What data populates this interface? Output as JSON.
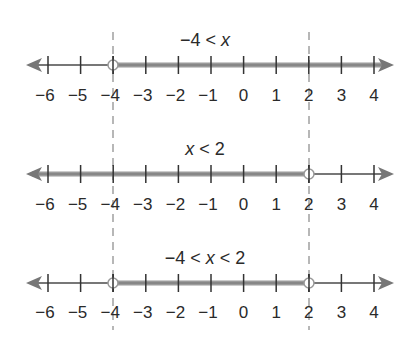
{
  "diagram": {
    "type": "number-line-inequalities",
    "tick_values": [
      -6,
      -5,
      -4,
      -3,
      -2,
      -1,
      0,
      1,
      2,
      3,
      4
    ],
    "tick_labels": [
      "−6",
      "−5",
      "−4",
      "−3",
      "−2",
      "−1",
      "0",
      "1",
      "2",
      "3",
      "4"
    ],
    "dashed_guides_at": [
      -4,
      2
    ],
    "colors": {
      "axis": "#777777",
      "shade": "#8a8a8a",
      "tick": "#333333",
      "text": "#2a2a2a",
      "dashed": "#888888"
    },
    "lines": [
      {
        "title": "−4 < x",
        "title_parts": [
          "−4 < ",
          "x"
        ],
        "solution_from": -4,
        "solution_to": "infinity",
        "open_circles": [
          -4
        ],
        "shade_direction": "right"
      },
      {
        "title": "x < 2",
        "title_parts": [
          "x",
          " < 2"
        ],
        "solution_from": "-infinity",
        "solution_to": 2,
        "open_circles": [
          2
        ],
        "shade_direction": "left"
      },
      {
        "title": "−4 < x < 2",
        "title_parts": [
          "−4 < ",
          "x",
          " < 2"
        ],
        "solution_from": -4,
        "solution_to": 2,
        "open_circles": [
          -4,
          2
        ],
        "shade_direction": "between"
      }
    ]
  }
}
